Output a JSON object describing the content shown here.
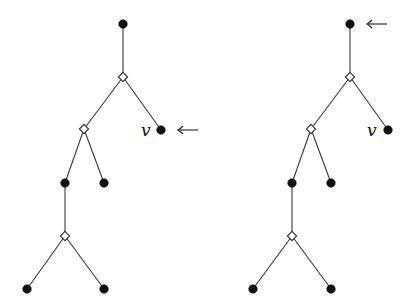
{
  "diagram": {
    "type": "tree-pair",
    "trees": [
      {
        "id": "left-tree",
        "nodes": [
          {
            "id": "root",
            "kind": "filled"
          },
          {
            "id": "d1",
            "kind": "diamond"
          },
          {
            "id": "v",
            "kind": "filled",
            "label": "v"
          },
          {
            "id": "d2",
            "kind": "diamond"
          },
          {
            "id": "a",
            "kind": "filled"
          },
          {
            "id": "b",
            "kind": "filled"
          },
          {
            "id": "d3",
            "kind": "diamond"
          },
          {
            "id": "c",
            "kind": "filled"
          },
          {
            "id": "e",
            "kind": "filled"
          }
        ],
        "edges": [
          [
            "root",
            "d1"
          ],
          [
            "d1",
            "d2"
          ],
          [
            "d1",
            "v"
          ],
          [
            "d2",
            "a"
          ],
          [
            "d2",
            "b"
          ],
          [
            "a",
            "d3"
          ],
          [
            "d3",
            "c"
          ],
          [
            "d3",
            "e"
          ]
        ],
        "arrow_target": "v",
        "arrow_glyph": "←"
      },
      {
        "id": "right-tree",
        "nodes": [
          {
            "id": "root",
            "kind": "filled"
          },
          {
            "id": "d1",
            "kind": "diamond"
          },
          {
            "id": "v",
            "kind": "filled",
            "label": "v"
          },
          {
            "id": "d2",
            "kind": "diamond"
          },
          {
            "id": "a",
            "kind": "filled"
          },
          {
            "id": "b",
            "kind": "filled"
          },
          {
            "id": "d3",
            "kind": "diamond"
          },
          {
            "id": "c",
            "kind": "filled"
          },
          {
            "id": "e",
            "kind": "filled"
          }
        ],
        "edges": [
          [
            "root",
            "d1"
          ],
          [
            "d1",
            "d2"
          ],
          [
            "d1",
            "v"
          ],
          [
            "d2",
            "a"
          ],
          [
            "d2",
            "b"
          ],
          [
            "a",
            "d3"
          ],
          [
            "d3",
            "c"
          ],
          [
            "d3",
            "e"
          ]
        ],
        "arrow_target": "root",
        "arrow_glyph": "←"
      }
    ],
    "labels": {
      "left_v": "v",
      "right_v": "v"
    }
  }
}
